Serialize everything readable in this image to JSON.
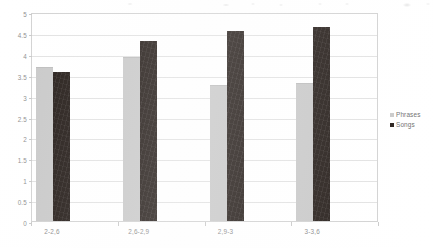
{
  "chart_data": {
    "type": "bar",
    "title": "",
    "subtitle": "",
    "xlabel": "",
    "ylabel": "",
    "categories": [
      "2-2,6",
      "2,6-2,9",
      "2,9-3",
      "3-3,6"
    ],
    "series": [
      {
        "name": "Phrases",
        "color": "#c9c9c9",
        "values": [
          3.68,
          3.92,
          3.25,
          3.3
        ]
      },
      {
        "name": "Songs",
        "color": "#241c18",
        "values": [
          3.56,
          4.31,
          4.55,
          4.64
        ]
      }
    ],
    "ylim": [
      0,
      5
    ],
    "ytick_step": 0.5,
    "ytick_labels": [
      "5",
      "4.5",
      "4",
      "3.5",
      "3",
      "2.5",
      "2",
      "1.5",
      "1",
      "0.5",
      "0"
    ],
    "grid": true,
    "legend_position": "right",
    "legend_entries": [
      "Phrases",
      "Songs"
    ]
  },
  "axis": {
    "y_label_color": "#8f8f8f",
    "x_label_color": "#8a8a8a",
    "gridline_color": "#e2e2e2",
    "frame_color": "#d2d2d2"
  },
  "legend": {
    "entries": [
      {
        "label": "Phrases",
        "swatch": "#c9c9c9"
      },
      {
        "label": "Songs",
        "swatch": "#241c18"
      }
    ]
  }
}
